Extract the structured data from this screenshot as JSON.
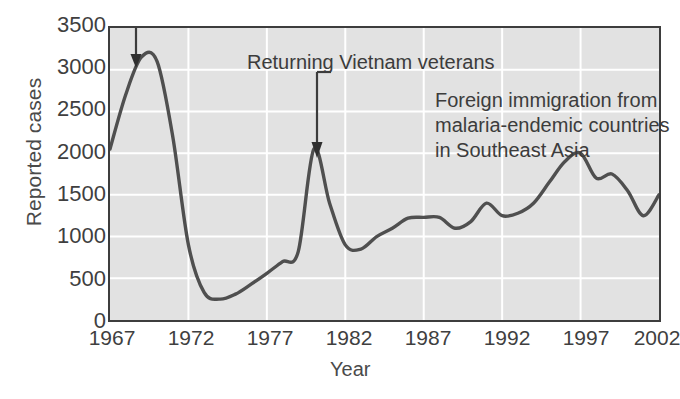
{
  "chart_data": {
    "type": "line",
    "title": "",
    "xlabel": "Year",
    "ylabel": "Reported cases",
    "xlim": [
      1967,
      2002
    ],
    "ylim": [
      0,
      3500
    ],
    "xticks": [
      "1967",
      "1972",
      "1977",
      "1982",
      "1987",
      "1992",
      "1997",
      "2002"
    ],
    "yticks": [
      "0",
      "500",
      "1000",
      "1500",
      "2000",
      "2500",
      "3000",
      "3500"
    ],
    "grid": true,
    "legend": "none",
    "series": [
      {
        "name": "Reported malaria cases",
        "x": [
          1967,
          1968,
          1969,
          1970,
          1971,
          1972,
          1973,
          1974,
          1975,
          1976,
          1977,
          1978,
          1979,
          1980,
          1981,
          1982,
          1983,
          1984,
          1985,
          1986,
          1987,
          1988,
          1989,
          1990,
          1991,
          1992,
          1993,
          1994,
          1995,
          1996,
          1997,
          1998,
          1999,
          2000,
          2001,
          2002
        ],
        "values": [
          2050,
          2700,
          3150,
          3100,
          2200,
          900,
          330,
          250,
          310,
          430,
          560,
          700,
          820,
          2050,
          1400,
          900,
          850,
          1000,
          1100,
          1220,
          1230,
          1230,
          1100,
          1180,
          1400,
          1250,
          1280,
          1400,
          1650,
          1900,
          2000,
          1700,
          1750,
          1550,
          1250,
          1500
        ]
      }
    ],
    "annotations": [
      {
        "name": "vietnam-veterans",
        "lines": [
          "Returning Vietnam veterans"
        ],
        "points_to_year": 1969,
        "points_to_value": 3150
      },
      {
        "name": "foreign-immigration",
        "lines": [
          "Foreign immigration from",
          "malaria-endemic countries",
          "in Southeast Asia"
        ],
        "points_to_year": 1980,
        "points_to_value": 2050
      }
    ]
  },
  "figure": {
    "caption": ""
  }
}
